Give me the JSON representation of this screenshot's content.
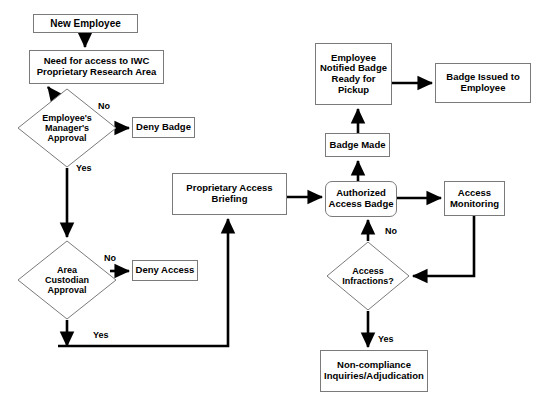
{
  "diagram": {
    "type": "flowchart",
    "colors": {
      "background": "#ffffff",
      "node_border": "#7a7a7a",
      "edge": "#000000",
      "text": "#000000"
    },
    "nodes": [
      {
        "id": "new-employee",
        "label": "New  Employee",
        "shape": "rect",
        "x": 33,
        "y": 14,
        "w": 105,
        "h": 19,
        "font_size": 10
      },
      {
        "id": "need-for-access",
        "label": "Need for access to IWC\nProprietary Research Area",
        "shape": "rect",
        "x": 29,
        "y": 50,
        "w": 135,
        "h": 34,
        "font_size": 9.5
      },
      {
        "id": "managers-approval",
        "label": "Employee's\nManager's\nApproval",
        "shape": "diamond",
        "x": 17,
        "y": 88,
        "w": 100,
        "h": 80,
        "font_size": 9
      },
      {
        "id": "deny-badge",
        "label": "Deny Badge",
        "shape": "rect",
        "x": 132,
        "y": 117,
        "w": 63,
        "h": 21,
        "font_size": 9.5
      },
      {
        "id": "area-custodian-approval",
        "label": "Area\nCustodian\nApproval",
        "shape": "diamond",
        "x": 17,
        "y": 240,
        "w": 100,
        "h": 80,
        "font_size": 9
      },
      {
        "id": "deny-access",
        "label": "Deny Access",
        "shape": "rect",
        "x": 132,
        "y": 260,
        "w": 66,
        "h": 21,
        "font_size": 9.5
      },
      {
        "id": "proprietary-access-briefing",
        "label": "Proprietary Access\nBriefing",
        "shape": "rect",
        "x": 172,
        "y": 173,
        "w": 115,
        "h": 42,
        "font_size": 9.5
      },
      {
        "id": "authorized-access-badge",
        "label": "Authorized\nAccess Badge",
        "shape": "rounded",
        "x": 325,
        "y": 181,
        "w": 72,
        "h": 36,
        "font_size": 9.5
      },
      {
        "id": "badge-made",
        "label": "Badge Made",
        "shape": "rect",
        "x": 325,
        "y": 133,
        "w": 65,
        "h": 24,
        "font_size": 9.5
      },
      {
        "id": "employee-notified-badge",
        "label": "Employee\nNotified Badge\nReady for\nPickup",
        "shape": "rect",
        "x": 315,
        "y": 43,
        "w": 77,
        "h": 62,
        "font_size": 9.5
      },
      {
        "id": "badge-issued",
        "label": "Badge Issued to\nEmployee",
        "shape": "rect",
        "x": 435,
        "y": 63,
        "w": 96,
        "h": 40,
        "font_size": 9.5
      },
      {
        "id": "access-monitoring",
        "label": "Access\nMonitoring",
        "shape": "rect",
        "x": 444,
        "y": 181,
        "w": 61,
        "h": 35,
        "font_size": 9.5
      },
      {
        "id": "access-infractions",
        "label": "Access\nInfractions?",
        "shape": "diamond",
        "x": 326,
        "y": 241,
        "w": 84,
        "h": 70,
        "font_size": 9
      },
      {
        "id": "non-compliance",
        "label": "Non-compliance\nInquiries/Adjudication",
        "shape": "rect",
        "x": 320,
        "y": 350,
        "w": 108,
        "h": 42,
        "font_size": 9.5
      }
    ],
    "edge_labels": [
      {
        "id": "managers-no",
        "text": "No",
        "x": 98,
        "y": 101
      },
      {
        "id": "managers-yes",
        "text": "Yes",
        "x": 76,
        "y": 163
      },
      {
        "id": "custodian-no",
        "text": "No",
        "x": 104,
        "y": 253
      },
      {
        "id": "custodian-yes",
        "text": "Yes",
        "x": 93,
        "y": 330
      },
      {
        "id": "infractions-no",
        "text": "No",
        "x": 385,
        "y": 226
      },
      {
        "id": "infractions-yes",
        "text": "Yes",
        "x": 378,
        "y": 334
      }
    ],
    "edges": [
      {
        "id": "new-employee-to-need",
        "from": "new-employee",
        "to": "need-for-access"
      },
      {
        "id": "need-to-managers",
        "from": "need-for-access",
        "to": "managers-approval"
      },
      {
        "id": "managers-no-to-deny-badge",
        "from": "managers-approval",
        "to": "deny-badge",
        "label": "No"
      },
      {
        "id": "managers-yes-to-custodian",
        "from": "managers-approval",
        "to": "area-custodian-approval",
        "label": "Yes"
      },
      {
        "id": "custodian-no-to-deny-access",
        "from": "area-custodian-approval",
        "to": "deny-access",
        "label": "No"
      },
      {
        "id": "custodian-yes-to-briefing",
        "from": "area-custodian-approval",
        "to": "proprietary-access-briefing",
        "label": "Yes"
      },
      {
        "id": "briefing-to-authorized",
        "from": "proprietary-access-briefing",
        "to": "authorized-access-badge"
      },
      {
        "id": "authorized-to-badge-made",
        "from": "authorized-access-badge",
        "to": "badge-made"
      },
      {
        "id": "badge-made-to-notified",
        "from": "badge-made",
        "to": "employee-notified-badge"
      },
      {
        "id": "notified-to-badge-issued",
        "from": "employee-notified-badge",
        "to": "badge-issued"
      },
      {
        "id": "authorized-to-monitoring",
        "from": "authorized-access-badge",
        "to": "access-monitoring"
      },
      {
        "id": "monitoring-to-infractions",
        "from": "access-monitoring",
        "to": "access-infractions"
      },
      {
        "id": "infractions-no-to-authorized",
        "from": "access-infractions",
        "to": "authorized-access-badge",
        "label": "No"
      },
      {
        "id": "infractions-yes-to-noncompliance",
        "from": "access-infractions",
        "to": "non-compliance",
        "label": "Yes"
      }
    ]
  }
}
